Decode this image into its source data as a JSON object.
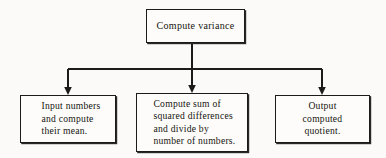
{
  "diagram": {
    "type": "flowchart",
    "background_color": "#fbfaf8",
    "line_color": "#1c1b1a",
    "box_fill_color": "#fdfcfa",
    "nodes": [
      {
        "id": "root",
        "label": "Compute variance",
        "role": "parent-process",
        "x": 146,
        "y": 9,
        "width": 99,
        "height": 34
      },
      {
        "id": "input",
        "label": "Input numbers\nand compute\ntheir mean.",
        "role": "child-process",
        "x": 20,
        "y": 95,
        "width": 96,
        "height": 48
      },
      {
        "id": "compute",
        "label": "Compute sum of\nsquared differences\nand divide by\nnumber of numbers.",
        "role": "child-process",
        "x": 136,
        "y": 93,
        "width": 112,
        "height": 59
      },
      {
        "id": "output",
        "label": "Output\ncomputed\nquotient.",
        "role": "child-process",
        "x": 275,
        "y": 95,
        "width": 95,
        "height": 48
      }
    ],
    "connectors": [
      {
        "id": "stem",
        "from": "root",
        "to": "bus",
        "kind": "vertical-line",
        "arrowhead": false
      },
      {
        "id": "bus",
        "kind": "horizontal-bus",
        "y": 69,
        "x_start": 68,
        "x_end": 322
      },
      {
        "id": "arrow-input",
        "from": "bus",
        "to": "input",
        "kind": "arrow-down",
        "x": 68,
        "arrowhead": true
      },
      {
        "id": "arrow-compute",
        "from": "bus",
        "to": "compute",
        "kind": "arrow-down",
        "x": 192,
        "arrowhead": true
      },
      {
        "id": "arrow-output",
        "from": "bus",
        "to": "output",
        "kind": "arrow-down",
        "x": 322,
        "arrowhead": true
      }
    ]
  }
}
